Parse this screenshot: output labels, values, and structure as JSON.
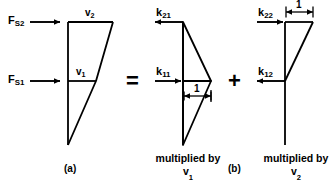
{
  "figure": {
    "panel_a": {
      "caption": "(a)",
      "force_labels": [
        {
          "name": "F_S2",
          "base": "F",
          "sub": "S2"
        },
        {
          "name": "F_S1",
          "base": "F",
          "sub": "S1"
        }
      ],
      "displacement_labels": [
        {
          "name": "v2",
          "base": "v",
          "sub": "2"
        },
        {
          "name": "v1",
          "base": "v",
          "sub": "1"
        }
      ]
    },
    "equals_sign": "=",
    "plus_sign": "+",
    "panel_b": {
      "caption": "(b)"
    },
    "term_1": {
      "stiffness_top": {
        "base": "k",
        "sub": "21"
      },
      "stiffness_bottom": {
        "base": "k",
        "sub": "11"
      },
      "unit_dimension": "1",
      "multiplier_line1": "multiplied by",
      "multiplier_base": "v",
      "multiplier_sub": "1"
    },
    "term_2": {
      "stiffness_top": {
        "base": "k",
        "sub": "22"
      },
      "stiffness_bottom": {
        "base": "k",
        "sub": "12"
      },
      "unit_dimension": "1",
      "multiplier_line1": "multiplied by",
      "multiplier_base": "v",
      "multiplier_sub": "2"
    }
  },
  "colors": {
    "ink": "#000000",
    "background": "#ffffff"
  }
}
